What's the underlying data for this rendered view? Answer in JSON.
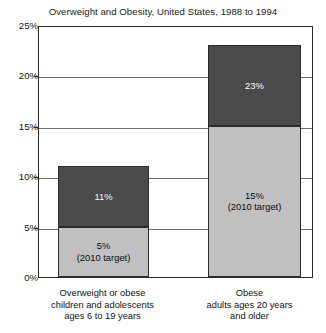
{
  "chart_data": {
    "type": "bar",
    "subtype": "stacked-bar",
    "title": "Overweight and Obesity, United States, 1988 to 1994",
    "xlabel": "",
    "ylabel": "",
    "ylim": [
      0,
      25
    ],
    "yticks": [
      0,
      5,
      10,
      15,
      20,
      25
    ],
    "ytick_labels": [
      "0%",
      "5%",
      "10%",
      "15%",
      "20%",
      "25%"
    ],
    "grid": true,
    "legend": "none",
    "categories": [
      "Overweight or obese children and adolescents ages 6 to 19 years",
      "Obese adults ages 20 years and older"
    ],
    "series": [
      {
        "name": "2010 target",
        "values": [
          5,
          15
        ],
        "color": "#c0c0c0",
        "text_color": "#0d0d0d"
      },
      {
        "name": "Current prevalence (1988 to 1994)",
        "values": [
          11,
          23
        ],
        "color": "#4a4a4a",
        "text_color": "#ffffff"
      }
    ],
    "bars": [
      {
        "category_lines": [
          "Overweight or obese",
          "children and adolescents",
          "ages 6 to 19 years"
        ],
        "top_value": 11,
        "top_label": "11%",
        "base_value": 5,
        "base_label": "5%",
        "base_sublabel": "(2010 target)"
      },
      {
        "category_lines": [
          "Obese",
          "adults ages 20 years",
          "and older"
        ],
        "top_value": 23,
        "top_label": "23%",
        "base_value": 15,
        "base_label": "15%",
        "base_sublabel": "(2010 target)"
      }
    ],
    "colors": {
      "dark_segment": "#4a4a4a",
      "light_segment": "#c0c0c0",
      "axis": "#2b2b2b",
      "gridline": "#6e6e6e",
      "background": "#ffffff"
    }
  }
}
